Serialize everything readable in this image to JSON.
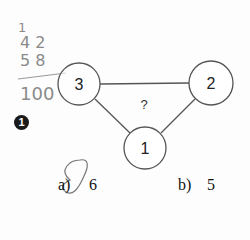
{
  "question": {
    "number": "1",
    "center_label": "?",
    "nodes": [
      {
        "id": "node-3",
        "label": "3"
      },
      {
        "id": "node-2",
        "label": "2"
      },
      {
        "id": "node-1",
        "label": "1"
      }
    ],
    "options": [
      {
        "letter": "a)",
        "value": "6",
        "circled": true
      },
      {
        "letter": "b)",
        "value": "5",
        "circled": false
      }
    ]
  },
  "handwriting": {
    "line1": "1",
    "line2": "4 2",
    "line3": "5 8",
    "result": "100"
  }
}
